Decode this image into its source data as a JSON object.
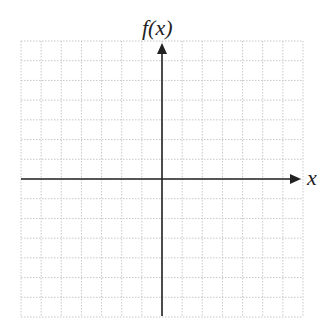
{
  "chart_data": {
    "type": "line",
    "title": "",
    "xlabel": "x",
    "ylabel": "f(x)",
    "series": [],
    "grid": {
      "on": true,
      "style": "dotted",
      "columns": 14,
      "rows": 14,
      "color": "#c8c8c8"
    },
    "axes": {
      "x_arrow": true,
      "y_arrow": true,
      "tick_labels": "none",
      "color": "#222222"
    }
  },
  "labels": {
    "y_axis": "f(x)",
    "x_axis": "x"
  }
}
